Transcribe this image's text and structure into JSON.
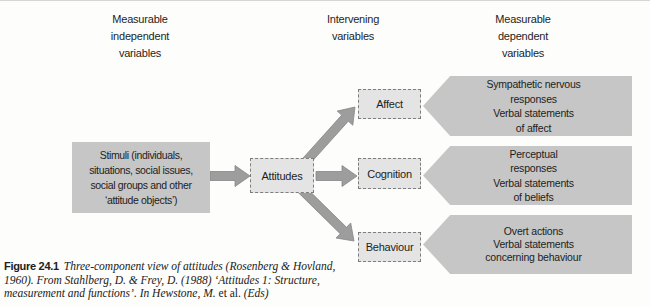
{
  "figure": {
    "headers": {
      "independent": "Measurable\nindependent\nvariables",
      "intervening": "Intervening\nvariables",
      "dependent": "Measurable\ndependent\nvariables"
    },
    "boxes": {
      "stimuli": "Stimuli (individuals,\nsituations, social issues,\nsocial groups and other\n‘attitude objects’)",
      "attitudes": "Attitudes",
      "affect": "Affect",
      "cognition": "Cognition",
      "behaviour": "Behaviour"
    },
    "banners": {
      "affect": "Sympathetic nervous\nresponses\nVerbal statements\nof affect",
      "cognition": "Perceptual\nresponses\nVerbal statements\nof beliefs",
      "behaviour": "Overt actions\nVerbal statements\nconcerning behaviour"
    },
    "caption": {
      "label": "Figure 24.1",
      "italic_1": "Three-component view of attitudes (Rosenberg & Hovland,\n1960). From Stahlberg, D. & Frey, D. (1988) ‘Attitudes 1: Structure,\nmeasurement and functions’. In Hewstone, M. ",
      "roman": "et al.",
      "italic_2": " (Eds)"
    },
    "colors": {
      "background": "#fdfdfb",
      "solid_box_fill": "#c6c6c6",
      "dashed_box_fill": "#e4e4e4",
      "dashed_border": "#7d7d7d",
      "arrow_fill": "#9d9d9d",
      "text": "#1d1d1d"
    }
  }
}
